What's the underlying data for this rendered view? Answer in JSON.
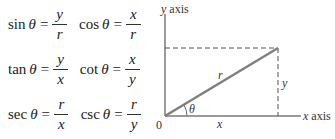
{
  "formulas": [
    {
      "fn": "sin",
      "var": "θ",
      "num": "y",
      "den": "r"
    },
    {
      "fn": "cos",
      "var": "θ",
      "num": "x",
      "den": "r"
    },
    {
      "fn": "tan",
      "var": "θ",
      "num": "y",
      "den": "x"
    },
    {
      "fn": "cot",
      "var": "θ",
      "num": "x",
      "den": "y"
    },
    {
      "fn": "sec",
      "var": "θ",
      "num": "r",
      "den": "x"
    },
    {
      "fn": "csc",
      "var": "θ",
      "num": "r",
      "den": "y"
    }
  ],
  "equals": "=",
  "diagram": {
    "y_axis_label_var": "y",
    "y_axis_label_word": "axis",
    "x_axis_label_var": "x",
    "x_axis_label_word": "axis",
    "origin_label": "0",
    "hypotenuse_label": "r",
    "adjacent_label": "x",
    "opposite_label": "y",
    "angle_label": "θ",
    "colors": {
      "axis": "#7a7a7a",
      "hypotenuse": "#808080",
      "dashed": "#555555",
      "text": "#333333"
    }
  }
}
